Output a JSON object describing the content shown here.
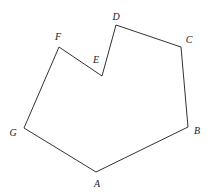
{
  "diagram": {
    "type": "polygon",
    "stroke_color": "#333333",
    "vertices": [
      {
        "name": "A",
        "x": 96,
        "y": 172,
        "label_x": 97,
        "label_y": 187
      },
      {
        "name": "B",
        "x": 188,
        "y": 127,
        "label_x": 197,
        "label_y": 134
      },
      {
        "name": "C",
        "x": 181,
        "y": 47,
        "label_x": 189,
        "label_y": 43
      },
      {
        "name": "D",
        "x": 116,
        "y": 25,
        "label_x": 116,
        "label_y": 20
      },
      {
        "name": "E",
        "x": 102,
        "y": 76,
        "label_x": 96,
        "label_y": 63
      },
      {
        "name": "F",
        "x": 59,
        "y": 47,
        "label_x": 58,
        "label_y": 40
      },
      {
        "name": "G",
        "x": 24,
        "y": 128,
        "label_x": 13,
        "label_y": 136
      }
    ]
  }
}
